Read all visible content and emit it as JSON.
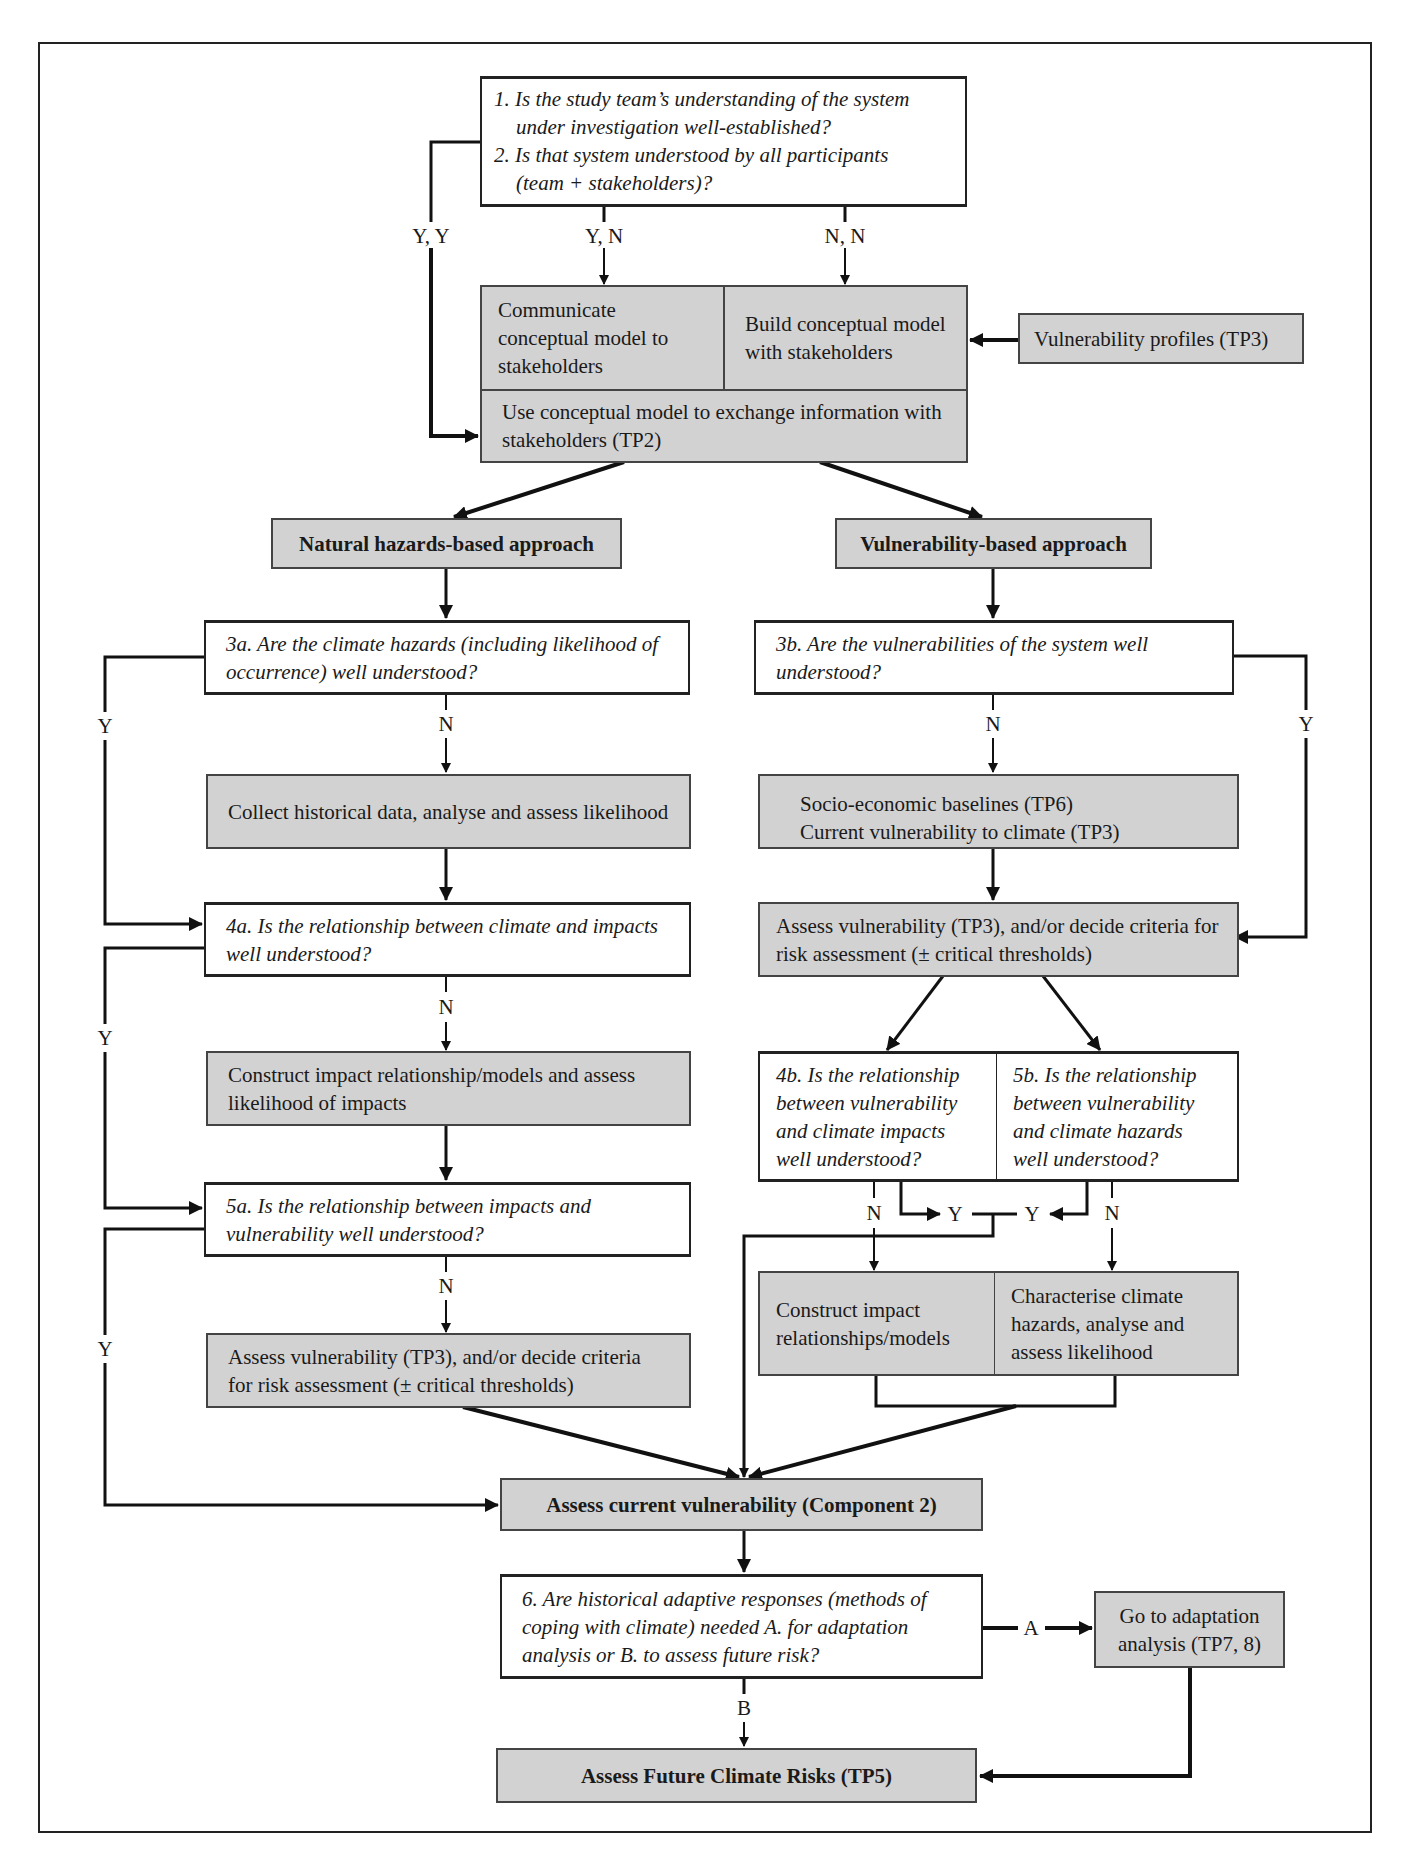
{
  "diagram": {
    "q1": {
      "line1": "1. Is the study team’s understanding of the system",
      "line2": "under investigation well-established?",
      "line3": "2. Is that system understood by all participants",
      "line4": "(team + stakeholders)?"
    },
    "labels": {
      "yy": "Y, Y",
      "yn": "Y, N",
      "nn": "N, N",
      "n": "N",
      "y": "Y",
      "a": "A",
      "b": "B"
    },
    "communicate": "Communicate conceptual model to stakeholders",
    "build": "Build conceptual model with stakeholders",
    "exchange": "Use conceptual model to exchange information with stakeholders (TP2)",
    "vuln_profiles": "Vulnerability profiles (TP3)",
    "natural_approach": "Natural hazards-based approach",
    "vulnerability_approach": "Vulnerability-based approach",
    "q3a": "3a. Are the climate hazards (including likelihood of occurrence) well understood?",
    "q3b": "3b. Are the vulnerabilities of the system well understood?",
    "collect": "Collect historical data, analyse and assess likelihood",
    "socio_line1": "Socio-economic baselines (TP6)",
    "socio_line2": "Current vulnerability to climate (TP3)",
    "q4a": "4a. Is the relationship between climate and impacts well understood?",
    "assess_vuln_right": "Assess vulnerability (TP3), and/or decide criteria for risk assessment (± critical thresholds)",
    "construct_left": "Construct impact relationship/models and assess likelihood of impacts",
    "q4b": "4b. Is the relationship between vulnerability and climate impacts well understood?",
    "q5b": "5b. Is the relationship between vulnerability and climate hazards well understood?",
    "q5a": "5a. Is the relationship between impacts and vulnerability well understood?",
    "construct_right": "Construct impact relationships/models",
    "characterise": "Characterise climate hazards, analyse and assess likelihood",
    "assess_vuln_left": "Assess vulnerability (TP3), and/or decide criteria for risk assessment (± critical thresholds)",
    "current_vuln": "Assess current vulnerability (Component 2)",
    "q6": "6. Are historical adaptive responses (methods of coping with climate) needed A. for adaptation analysis or B. to assess future risk?",
    "go_adaptation": "Go to adaptation analysis (TP7, 8)",
    "future_risks": "Assess Future Climate Risks (TP5)"
  },
  "colors": {
    "box_fill": "#d2d2d2",
    "line": "#111111"
  }
}
